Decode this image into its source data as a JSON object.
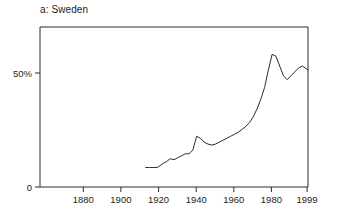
{
  "chart_data": {
    "type": "line",
    "title": "a: Sweden",
    "xlabel": "",
    "ylabel": "",
    "xlim": [
      1857,
      1999
    ],
    "ylim": [
      0,
      82
    ],
    "grid": false,
    "legend": null,
    "x_ticks": [
      1880,
      1900,
      1920,
      1940,
      1960,
      1980,
      1999
    ],
    "x_tick_labels": [
      "1880",
      "1900",
      "1920",
      "1940",
      "1960",
      "1980",
      "1999"
    ],
    "y_ticks": [
      0,
      50
    ],
    "y_tick_labels": [
      "0",
      "50%"
    ],
    "series": [
      {
        "name": "Sweden",
        "color": "#2b2b2b",
        "x": [
          1913,
          1915,
          1917,
          1919,
          1920,
          1922,
          1924,
          1926,
          1928,
          1930,
          1932,
          1934,
          1936,
          1938,
          1940,
          1942,
          1944,
          1946,
          1948,
          1950,
          1952,
          1954,
          1956,
          1958,
          1960,
          1962,
          1964,
          1966,
          1968,
          1970,
          1972,
          1974,
          1976,
          1978,
          1980,
          1982,
          1984,
          1986,
          1988,
          1990,
          1992,
          1994,
          1996,
          1999
        ],
        "values": [
          10,
          10,
          10,
          10,
          10.5,
          12,
          13,
          14.5,
          14,
          15,
          16,
          17,
          17,
          19,
          26,
          25,
          23,
          22,
          21.5,
          22,
          23,
          24,
          25,
          26,
          27,
          28,
          29.5,
          31,
          33,
          36,
          40,
          45,
          51,
          60,
          68,
          67,
          62,
          57,
          55,
          57,
          59,
          61,
          62,
          60
        ]
      }
    ]
  }
}
